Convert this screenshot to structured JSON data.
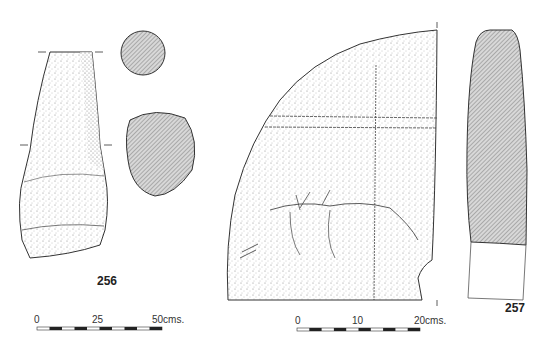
{
  "objects": [
    {
      "id": "256",
      "label": "256",
      "description": "stone pestle elevation with two hatched cross-sections"
    },
    {
      "id": "257",
      "label": "257",
      "description": "hatched section profile"
    },
    {
      "id": "slab",
      "label": "",
      "description": "quarter-circle incised stone slab fragment"
    }
  ],
  "scale_bars": [
    {
      "name": "scale-50cm",
      "ticks": [
        "0",
        "25",
        "50cms."
      ],
      "segments": 10
    },
    {
      "name": "scale-20cm",
      "ticks": [
        "0",
        "10",
        "20cms."
      ],
      "segments": 10
    }
  ],
  "colors": {
    "ink": "#333333",
    "hatch": "#9a9a9a",
    "stipple": "#888888"
  }
}
